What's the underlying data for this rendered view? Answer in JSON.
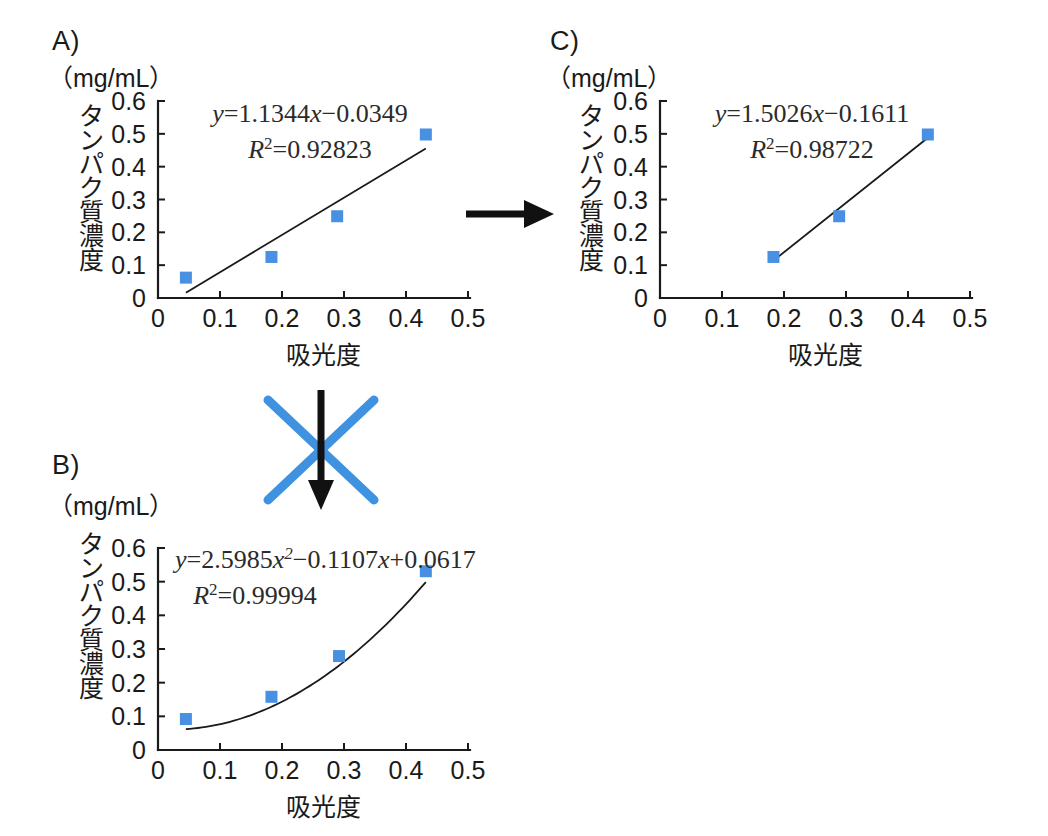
{
  "figure": {
    "unit_label": "（mg/mL）",
    "axis_x_title": "吸光度",
    "axis_y_title": "タンパク質濃度",
    "marker_color": "#4a90e2",
    "line_color": "#1a1a1a",
    "cross_color": "#3f92e0",
    "arrow_color": "#111111"
  },
  "panels": [
    {
      "id": "A",
      "label": "A)",
      "equation_main": "y=1.1344x−0.0349",
      "equation_r2": "R2=0.92823",
      "r2_base": "R",
      "r2_exp": "2",
      "r2_value": "=0.92823"
    },
    {
      "id": "B",
      "label": "B)",
      "equation_main": "y=2.5985x2−0.1107x+0.0617",
      "equation_r2": "R2=0.99994",
      "r2_base": "R",
      "r2_exp": "2",
      "r2_value": "=0.99994"
    },
    {
      "id": "C",
      "label": "C)",
      "equation_main": "y=1.5026x−0.1611",
      "equation_r2": "R2=0.98722",
      "r2_base": "R",
      "r2_exp": "2",
      "r2_value": "=0.98722"
    }
  ],
  "annotations": {
    "arrow_right": "arrow-a-to-c",
    "arrow_down": "arrow-a-to-b",
    "cross_mark": "rejected-x-mark"
  },
  "chart_data": [
    {
      "panel": "A",
      "type": "scatter",
      "title": "A)",
      "xlabel": "吸光度",
      "ylabel": "タンパク質濃度",
      "yunit": "（mg/mL）",
      "xlim": [
        0,
        0.5
      ],
      "ylim": [
        0,
        0.6
      ],
      "xticks": [
        0,
        0.1,
        0.2,
        0.3,
        0.4,
        0.5
      ],
      "xticklabels": [
        "0",
        "0.1",
        "0.2",
        "0.3",
        "0.4",
        "0.5"
      ],
      "yticks": [
        0,
        0.1,
        0.2,
        0.3,
        0.4,
        0.5,
        0.6
      ],
      "yticklabels": [
        "0",
        "0.1",
        "0.2",
        "0.3",
        "0.4",
        "0.5",
        "0.6"
      ],
      "grid": false,
      "legend": "none",
      "x": [
        0.045,
        0.183,
        0.289,
        0.432
      ],
      "y": [
        0.062,
        0.125,
        0.249,
        0.498
      ],
      "fit": {
        "kind": "linear",
        "slope": 1.1344,
        "intercept": -0.0349,
        "r2": 0.92823,
        "equation": "y=1.1344x−0.0349",
        "x_start": 0.045,
        "x_end": 0.432
      }
    },
    {
      "panel": "B",
      "type": "scatter",
      "title": "B)",
      "xlabel": "吸光度",
      "ylabel": "タンパク質濃度",
      "yunit": "（mg/mL）",
      "xlim": [
        0,
        0.5
      ],
      "ylim": [
        0,
        0.6
      ],
      "xticks": [
        0,
        0.1,
        0.2,
        0.3,
        0.4,
        0.5
      ],
      "xticklabels": [
        "0",
        "0.1",
        "0.2",
        "0.3",
        "0.4",
        "0.5"
      ],
      "yticks": [
        0,
        0.1,
        0.2,
        0.3,
        0.4,
        0.5,
        0.6
      ],
      "yticklabels": [
        "0",
        "0.1",
        "0.2",
        "0.3",
        "0.4",
        "0.5",
        "0.6"
      ],
      "grid": false,
      "legend": "none",
      "x": [
        0.045,
        0.183,
        0.292,
        0.432
      ],
      "y": [
        0.092,
        0.158,
        0.279,
        0.531
      ],
      "fit": {
        "kind": "quadratic",
        "a": 2.5985,
        "b": -0.1107,
        "c": 0.0617,
        "r2": 0.99994,
        "equation": "y=2.5985x²−0.1107x+0.0617",
        "x_start": 0.045,
        "x_end": 0.432
      }
    },
    {
      "panel": "C",
      "type": "scatter",
      "title": "C)",
      "xlabel": "吸光度",
      "ylabel": "タンパク質濃度",
      "yunit": "（mg/mL）",
      "xlim": [
        0,
        0.5
      ],
      "ylim": [
        0,
        0.6
      ],
      "xticks": [
        0,
        0.1,
        0.2,
        0.3,
        0.4,
        0.5
      ],
      "xticklabels": [
        "0",
        "0.1",
        "0.2",
        "0.3",
        "0.4",
        "0.5"
      ],
      "yticks": [
        0,
        0.1,
        0.2,
        0.3,
        0.4,
        0.5,
        0.6
      ],
      "yticklabels": [
        "0",
        "0.1",
        "0.2",
        "0.3",
        "0.4",
        "0.5",
        "0.6"
      ],
      "grid": false,
      "legend": "none",
      "x": [
        0.183,
        0.289,
        0.432
      ],
      "y": [
        0.125,
        0.249,
        0.498
      ],
      "fit": {
        "kind": "linear",
        "slope": 1.5026,
        "intercept": -0.1611,
        "r2": 0.98722,
        "equation": "y=1.5026x−0.1611",
        "x_start": 0.183,
        "x_end": 0.432
      }
    }
  ]
}
